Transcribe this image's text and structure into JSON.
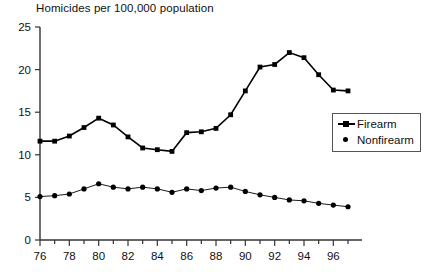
{
  "chart_data": {
    "type": "line",
    "title": "Homicides per 100,000 population",
    "xlabel": "",
    "ylabel": "",
    "ylim": [
      0,
      25
    ],
    "yticks": [
      0,
      5,
      10,
      15,
      20,
      25
    ],
    "xlim": [
      1976,
      1997
    ],
    "xticks_major": [
      76,
      78,
      80,
      82,
      84,
      86,
      88,
      90,
      92,
      94,
      96
    ],
    "xticks_minor": [
      77,
      79,
      81,
      83,
      85,
      87,
      89,
      91,
      93,
      95,
      97
    ],
    "grid": false,
    "legend_position": "right-middle",
    "x": [
      1976,
      1977,
      1978,
      1979,
      1980,
      1981,
      1982,
      1983,
      1984,
      1985,
      1986,
      1987,
      1988,
      1989,
      1990,
      1991,
      1992,
      1993,
      1994,
      1995,
      1996,
      1997
    ],
    "categories": [
      "76",
      "77",
      "78",
      "79",
      "80",
      "81",
      "82",
      "83",
      "84",
      "85",
      "86",
      "87",
      "88",
      "89",
      "90",
      "91",
      "92",
      "93",
      "94",
      "95",
      "96",
      "97"
    ],
    "series": [
      {
        "name": "Firearm",
        "marker": "square",
        "values": [
          11.6,
          11.6,
          12.2,
          13.2,
          14.3,
          13.5,
          12.1,
          10.8,
          10.6,
          10.4,
          12.6,
          12.7,
          13.1,
          14.7,
          17.5,
          20.3,
          20.6,
          22.0,
          21.4,
          19.4,
          17.6,
          17.5
        ]
      },
      {
        "name": "Nonfirearm",
        "marker": "circle",
        "values": [
          5.1,
          5.2,
          5.4,
          6.0,
          6.6,
          6.2,
          6.0,
          6.2,
          6.0,
          5.6,
          6.0,
          5.8,
          6.1,
          6.2,
          5.7,
          5.3,
          5.0,
          4.7,
          4.6,
          4.3,
          4.1,
          3.9
        ]
      }
    ]
  },
  "legend": {
    "items": [
      {
        "label": "Firearm"
      },
      {
        "label": "Nonfirearm"
      }
    ]
  },
  "axis": {
    "y_tick_labels": [
      "25",
      "20",
      "15",
      "10",
      "5",
      "0"
    ],
    "x_tick_labels": [
      "76",
      "78",
      "80",
      "82",
      "84",
      "86",
      "88",
      "90",
      "92",
      "94",
      "96"
    ]
  }
}
